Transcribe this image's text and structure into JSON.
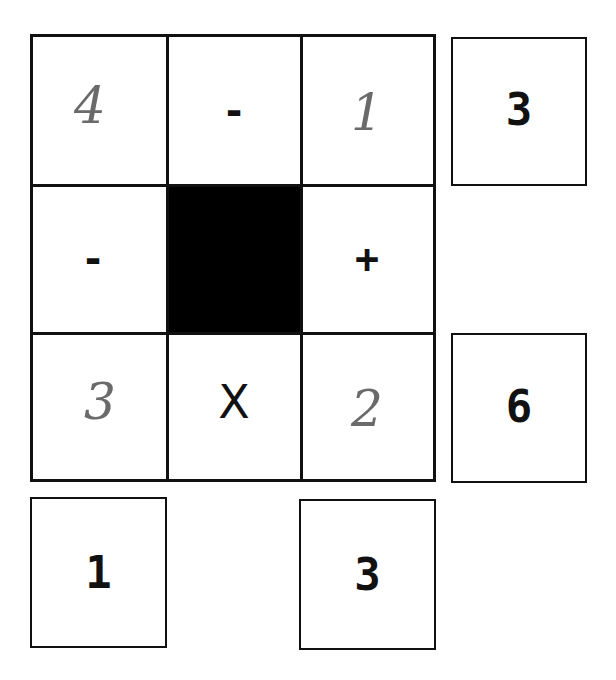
{
  "puzzle": {
    "grid": [
      [
        {
          "value": "4",
          "kind": "handwritten"
        },
        {
          "value": "-",
          "kind": "operator"
        },
        {
          "value": "1",
          "kind": "handwritten"
        }
      ],
      [
        {
          "value": "-",
          "kind": "operator"
        },
        {
          "value": "",
          "kind": "blocked"
        },
        {
          "value": "+",
          "kind": "operator"
        }
      ],
      [
        {
          "value": "3",
          "kind": "handwritten"
        },
        {
          "value": "X",
          "kind": "operator"
        },
        {
          "value": "2",
          "kind": "handwritten"
        }
      ]
    ],
    "row_results": [
      {
        "row": 1,
        "value": "3"
      },
      {
        "row": 3,
        "value": "6"
      }
    ],
    "column_results": [
      {
        "column": 1,
        "value": "1"
      },
      {
        "column": 3,
        "value": "3"
      }
    ]
  },
  "colors": {
    "border": "#111111",
    "blocked": "#000000",
    "handwriting": "#6a6a6a",
    "background": "#ffffff"
  }
}
